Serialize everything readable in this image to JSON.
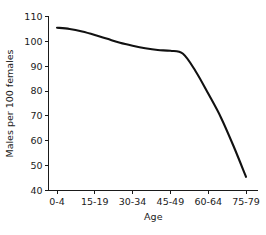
{
  "chart_data": {
    "type": "line",
    "title": "",
    "xlabel": "Age",
    "ylabel": "Males per 100 females",
    "ylim": [
      40,
      110
    ],
    "yticks": [
      40,
      50,
      60,
      70,
      80,
      90,
      100,
      110
    ],
    "ytick_labels": [
      "40",
      "50",
      "60",
      "70",
      "80",
      "90",
      "100",
      "110"
    ],
    "grid": false,
    "legend": null,
    "categories": [
      "0-4",
      "5-9",
      "10-14",
      "15-19",
      "20-24",
      "25-29",
      "30-34",
      "35-39",
      "40-44",
      "45-49",
      "50-54",
      "55-59",
      "60-64",
      "65-69",
      "70-74",
      "75-79"
    ],
    "xtick_labels": [
      "0-4",
      "15-19",
      "30-34",
      "45-49",
      "60-64",
      "75-79"
    ],
    "xtick_label_indices": [
      0,
      3,
      6,
      9,
      12,
      15
    ],
    "values": [
      105.5,
      105.0,
      104.0,
      102.6,
      101.0,
      99.4,
      98.2,
      97.2,
      96.5,
      96.2,
      95.0,
      88.0,
      79.0,
      69.5,
      58.0,
      45.5
    ],
    "line_color": "#111111",
    "axis_color": "#1a1a1a",
    "background_color": "#ffffff"
  }
}
